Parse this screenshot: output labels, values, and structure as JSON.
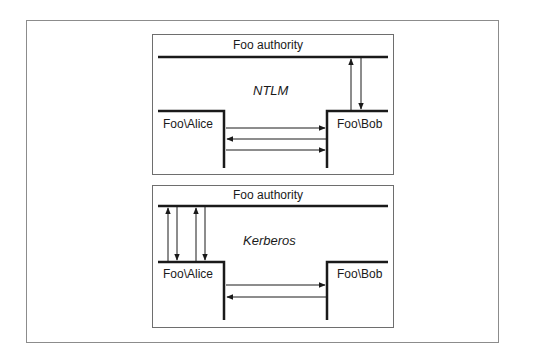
{
  "figure": {
    "panels": [
      {
        "protocol": "NTLM",
        "authority_label": "Foo authority",
        "client_label": "Foo\\Alice",
        "server_label": "Foo\\Bob",
        "exchanges": [
          {
            "from": "Foo\\Alice",
            "to": "Foo\\Bob"
          },
          {
            "from": "Foo\\Bob",
            "to": "Foo\\Alice"
          },
          {
            "from": "Foo\\Alice",
            "to": "Foo\\Bob"
          },
          {
            "from": "Foo\\Bob",
            "to": "Foo authority"
          },
          {
            "from": "Foo authority",
            "to": "Foo\\Bob"
          }
        ]
      },
      {
        "protocol": "Kerberos",
        "authority_label": "Foo authority",
        "client_label": "Foo\\Alice",
        "server_label": "Foo\\Bob",
        "exchanges": [
          {
            "from": "Foo\\Alice",
            "to": "Foo authority"
          },
          {
            "from": "Foo authority",
            "to": "Foo\\Alice"
          },
          {
            "from": "Foo\\Alice",
            "to": "Foo authority"
          },
          {
            "from": "Foo authority",
            "to": "Foo\\Alice"
          },
          {
            "from": "Foo\\Alice",
            "to": "Foo\\Bob"
          },
          {
            "from": "Foo\\Bob",
            "to": "Foo\\Alice"
          }
        ]
      }
    ],
    "colors": {
      "line": "#1a1a1a",
      "frame": "#8c8c8c",
      "background": "#ffffff"
    }
  }
}
